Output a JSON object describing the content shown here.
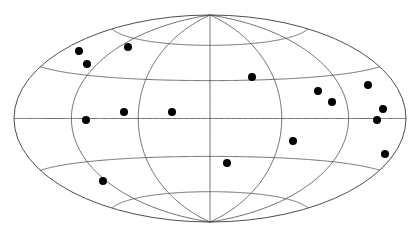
{
  "chart_data": {
    "type": "scatter",
    "projection": "hammer",
    "title": "",
    "xlabel": "",
    "ylabel": "",
    "grid": true,
    "meridian_step_deg": 60,
    "parallel_step_deg": 30,
    "frame": {
      "cx": 210,
      "cy": 118.5,
      "half_width": 196,
      "half_height": 103.5
    },
    "style": {
      "line_color": "#4a4a4a",
      "point_color": "#000000",
      "point_radius": 4
    },
    "points_px": [
      {
        "x": 79,
        "y": 51
      },
      {
        "x": 87,
        "y": 64
      },
      {
        "x": 128,
        "y": 47
      },
      {
        "x": 86,
        "y": 120
      },
      {
        "x": 124,
        "y": 112
      },
      {
        "x": 172,
        "y": 112
      },
      {
        "x": 103,
        "y": 181
      },
      {
        "x": 227,
        "y": 163
      },
      {
        "x": 252,
        "y": 77
      },
      {
        "x": 293,
        "y": 141
      },
      {
        "x": 318,
        "y": 91
      },
      {
        "x": 332,
        "y": 102
      },
      {
        "x": 368,
        "y": 85
      },
      {
        "x": 383,
        "y": 109
      },
      {
        "x": 377,
        "y": 120
      },
      {
        "x": 385,
        "y": 154
      }
    ]
  }
}
